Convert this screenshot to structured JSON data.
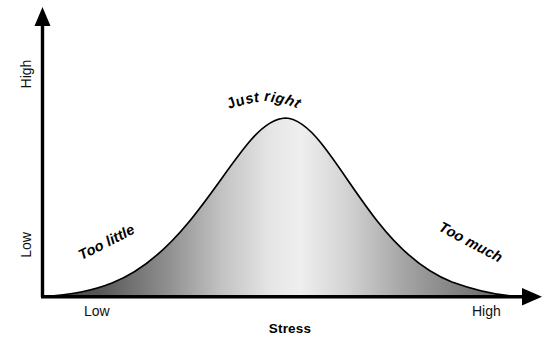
{
  "chart_data": {
    "type": "area",
    "title": "",
    "subtitle": "",
    "xlabel": "Stress",
    "ylabel": "",
    "xtick_labels": [
      "Low",
      "High"
    ],
    "ytick_labels": [
      "Low",
      "High"
    ],
    "grid": false,
    "legend": "none",
    "xlim": [
      0,
      1
    ],
    "ylim": [
      0,
      1
    ],
    "curve_shape": "bell / gaussian",
    "peak": {
      "x": 0.5,
      "y": 1.0
    },
    "x": [
      0.0,
      0.05,
      0.1,
      0.15,
      0.2,
      0.25,
      0.3,
      0.35,
      0.4,
      0.45,
      0.5,
      0.55,
      0.6,
      0.65,
      0.7,
      0.75,
      0.8,
      0.85,
      0.9,
      0.95,
      1.0
    ],
    "values": [
      0.0,
      0.02,
      0.05,
      0.1,
      0.18,
      0.3,
      0.45,
      0.62,
      0.8,
      0.94,
      1.0,
      0.96,
      0.86,
      0.72,
      0.56,
      0.41,
      0.28,
      0.18,
      0.1,
      0.04,
      0.0
    ],
    "fill_gradient": {
      "direction": "horizontal",
      "stops": [
        "#3f3f3f",
        "#6e6e6e",
        "#d9d9d9",
        "#ededed",
        "#cfcfcf",
        "#8a8a8a",
        "#6a6a6a"
      ]
    },
    "line_color": "#000000",
    "annotations": [
      {
        "text": "Too little",
        "region": "left-tail",
        "rotation_deg": -27
      },
      {
        "text": "Just right",
        "region": "peak",
        "rotation_deg": 0,
        "style": "arched"
      },
      {
        "text": "Too much",
        "region": "right-tail",
        "rotation_deg": 28
      }
    ],
    "axis_style": "arrow-headed L axes",
    "axes": {
      "y_axis": {
        "label_low": "Low",
        "label_high": "High",
        "arrow": "up"
      },
      "x_axis": {
        "label_low": "Low",
        "label_high": "High",
        "arrow": "right"
      }
    }
  },
  "axis": {
    "y_low": "Low",
    "y_high": "High",
    "x_low": "Low",
    "x_high": "High",
    "x_title": "Stress"
  },
  "annotations": {
    "left": "Too little",
    "peak": "Just right",
    "right": "Too much"
  },
  "colors": {
    "line": "#000000",
    "axis": "#000000",
    "fill_dark": "#3f3f3f",
    "fill_light": "#ededed",
    "fill_right": "#6a6a6a",
    "text": "#111111",
    "background": "#ffffff"
  }
}
